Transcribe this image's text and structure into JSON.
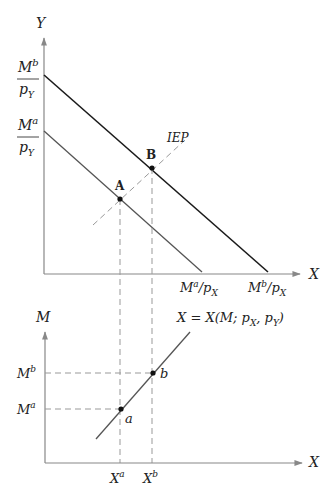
{
  "top_panel": {
    "y_axis_label": "Y",
    "x_axis_label": "X",
    "y_intercept_b": {
      "num": "M",
      "num_sup": "b",
      "den": "p",
      "den_sub": "Y"
    },
    "y_intercept_a": {
      "num": "M",
      "num_sup": "a",
      "den": "p",
      "den_sub": "Y"
    },
    "x_intercept_a": {
      "base": "M",
      "sup": "a",
      "rest": "/p",
      "sub": "X"
    },
    "x_intercept_b": {
      "base": "M",
      "sup": "b",
      "rest": "/p",
      "sub": "X"
    },
    "iep_label": "IEP",
    "point_A": "A",
    "point_B": "B"
  },
  "bottom_panel": {
    "y_axis_label": "M",
    "x_axis_label": "X",
    "engel_label": {
      "pre": "X = X(M; p",
      "sub1": "X",
      "mid": ", p",
      "sub2": "Y",
      "post": ")"
    },
    "m_b": {
      "base": "M",
      "sup": "b"
    },
    "m_a": {
      "base": "M",
      "sup": "a"
    },
    "x_a": {
      "base": "X",
      "sup": "a"
    },
    "x_b": {
      "base": "X",
      "sup": "b"
    },
    "point_a": "a",
    "point_b": "b"
  },
  "colors": {
    "outer_line": "#1a1a1a",
    "inner_line": "#555555",
    "axis": "#888888",
    "dash": "#999999"
  }
}
